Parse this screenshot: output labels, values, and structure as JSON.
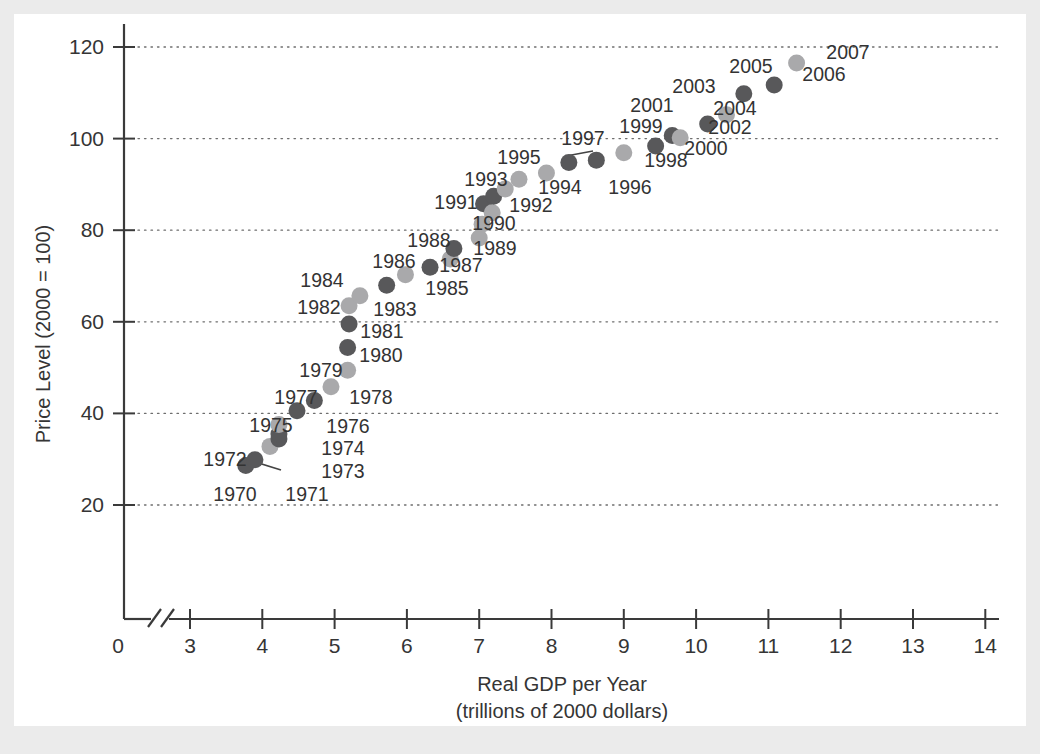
{
  "chart_data": {
    "type": "scatter",
    "title": "",
    "xlabel": "Real GDP per Year",
    "xlabel_sub": "(trillions of 2000 dollars)",
    "ylabel": "Price Level (2000 = 100)",
    "xlim": [
      3,
      14
    ],
    "ylim": [
      0,
      125
    ],
    "x_ticks": [
      "0",
      "3",
      "4",
      "5",
      "6",
      "7",
      "8",
      "9",
      "10",
      "11",
      "12",
      "13",
      "14"
    ],
    "y_ticks": [
      "20",
      "40",
      "60",
      "80",
      "100",
      "120"
    ],
    "grid": "horizontal dotted gridlines at each y tick",
    "axis_break": "broken x-axis between 0 and 3",
    "legend": "none",
    "marker_colors": {
      "dark": "#58585a",
      "light": "#a9a9ab"
    },
    "points": [
      {
        "label": "1970",
        "x": 3.772,
        "y": 28.6,
        "shade": "dark",
        "lx": 235,
        "ly": 501,
        "anchor": "middle"
      },
      {
        "label": "1971",
        "x": 3.898,
        "y": 29.9,
        "shade": "dark",
        "lx": 307,
        "ly": 501,
        "anchor": "middle"
      },
      {
        "label": "1972",
        "x": 4.106,
        "y": 32.8,
        "shade": "light",
        "lx": 225,
        "ly": 466,
        "anchor": "middle",
        "leader": [
          252,
          461,
          281,
          470
        ]
      },
      {
        "label": "1973",
        "x": 4.23,
        "y": 34.4,
        "shade": "dark",
        "lx": 343,
        "ly": 478,
        "anchor": "middle"
      },
      {
        "label": "1974",
        "x": 4.23,
        "y": 35.5,
        "shade": "dark",
        "lx": 343,
        "ly": 455,
        "anchor": "middle"
      },
      {
        "label": "1975",
        "x": 4.23,
        "y": 37.6,
        "shade": "light",
        "lx": 271,
        "ly": 432,
        "anchor": "middle"
      },
      {
        "label": "1976",
        "x": 4.48,
        "y": 40.6,
        "shade": "dark",
        "lx": 348,
        "ly": 433,
        "anchor": "middle"
      },
      {
        "label": "1977",
        "x": 4.72,
        "y": 42.8,
        "shade": "dark",
        "lx": 296,
        "ly": 404,
        "anchor": "middle"
      },
      {
        "label": "1978",
        "x": 4.95,
        "y": 45.8,
        "shade": "light",
        "lx": 371,
        "ly": 404,
        "anchor": "middle"
      },
      {
        "label": "1979",
        "x": 5.18,
        "y": 49.4,
        "shade": "light",
        "lx": 321,
        "ly": 377,
        "anchor": "middle"
      },
      {
        "label": "1980",
        "x": 5.18,
        "y": 54.4,
        "shade": "dark",
        "lx": 381,
        "ly": 362,
        "anchor": "middle"
      },
      {
        "label": "1981",
        "x": 5.2,
        "y": 59.5,
        "shade": "dark",
        "lx": 382,
        "ly": 338,
        "anchor": "middle"
      },
      {
        "label": "1982",
        "x": 5.2,
        "y": 63.5,
        "shade": "light",
        "lx": 319,
        "ly": 314,
        "anchor": "middle"
      },
      {
        "label": "1983",
        "x": 5.35,
        "y": 65.7,
        "shade": "light",
        "lx": 395,
        "ly": 316,
        "anchor": "middle"
      },
      {
        "label": "1984",
        "x": 5.72,
        "y": 68.0,
        "shade": "dark",
        "lx": 322,
        "ly": 287,
        "anchor": "middle"
      },
      {
        "label": "1985",
        "x": 5.98,
        "y": 70.3,
        "shade": "light",
        "lx": 447,
        "ly": 295,
        "anchor": "middle"
      },
      {
        "label": "1986",
        "x": 6.32,
        "y": 71.9,
        "shade": "dark",
        "lx": 394,
        "ly": 268,
        "anchor": "middle"
      },
      {
        "label": "1987",
        "x": 6.6,
        "y": 73.7,
        "shade": "light",
        "lx": 461,
        "ly": 272,
        "anchor": "middle"
      },
      {
        "label": "1988",
        "x": 6.65,
        "y": 76.0,
        "shade": "dark",
        "lx": 429,
        "ly": 247,
        "anchor": "middle"
      },
      {
        "label": "1989",
        "x": 7.0,
        "y": 78.3,
        "shade": "light",
        "lx": 495,
        "ly": 255,
        "anchor": "middle"
      },
      {
        "label": "1990",
        "x": 7.04,
        "y": 81.3,
        "shade": "light",
        "lx": 494,
        "ly": 230,
        "anchor": "middle"
      },
      {
        "label": "1991",
        "x": 7.06,
        "y": 85.8,
        "shade": "dark",
        "lx": 456,
        "ly": 209,
        "anchor": "middle"
      },
      {
        "label": "1992",
        "x": 7.18,
        "y": 83.8,
        "shade": "light",
        "lx": 531,
        "ly": 212,
        "anchor": "middle"
      },
      {
        "label": "1993",
        "x": 7.2,
        "y": 87.4,
        "shade": "dark",
        "lx": 486,
        "ly": 186,
        "anchor": "middle"
      },
      {
        "label": "1994",
        "x": 7.36,
        "y": 89.0,
        "shade": "light",
        "lx": 560,
        "ly": 194,
        "anchor": "middle"
      },
      {
        "label": "1995",
        "x": 7.55,
        "y": 91.1,
        "shade": "light",
        "lx": 519,
        "ly": 164,
        "anchor": "middle"
      },
      {
        "label": "1996",
        "x": 7.93,
        "y": 92.5,
        "shade": "light",
        "lx": 630,
        "ly": 194,
        "anchor": "middle"
      },
      {
        "label": "1997",
        "x": 8.24,
        "y": 94.8,
        "shade": "dark",
        "lx": 583,
        "ly": 145,
        "anchor": "middle"
      },
      {
        "label": "1998",
        "x": 8.62,
        "y": 95.3,
        "shade": "dark",
        "lx": 666,
        "ly": 167,
        "anchor": "middle"
      },
      {
        "label": "1999",
        "x": 9.0,
        "y": 96.9,
        "shade": "light",
        "lx": 641,
        "ly": 133,
        "anchor": "middle"
      },
      {
        "label": "2000",
        "x": 9.44,
        "y": 98.4,
        "shade": "dark",
        "lx": 706,
        "ly": 155,
        "anchor": "middle"
      },
      {
        "label": "2001",
        "x": 9.67,
        "y": 100.7,
        "shade": "dark",
        "lx": 652,
        "ly": 112,
        "anchor": "middle"
      },
      {
        "label": "2002",
        "x": 9.78,
        "y": 100.2,
        "shade": "light",
        "lx": 730,
        "ly": 134,
        "anchor": "middle"
      },
      {
        "label": "2003",
        "x": 10.16,
        "y": 103.2,
        "shade": "dark",
        "lx": 694,
        "ly": 93,
        "anchor": "middle"
      },
      {
        "label": "2004",
        "x": 10.42,
        "y": 105.2,
        "shade": "light",
        "lx": 735,
        "ly": 115,
        "anchor": "middle"
      },
      {
        "label": "2005",
        "x": 10.66,
        "y": 109.8,
        "shade": "dark",
        "lx": 751,
        "ly": 73,
        "anchor": "middle"
      },
      {
        "label": "2006",
        "x": 11.08,
        "y": 111.7,
        "shade": "dark",
        "lx": 824,
        "ly": 81,
        "anchor": "middle"
      },
      {
        "label": "2007",
        "x": 11.39,
        "y": 116.5,
        "shade": "light",
        "lx": 848,
        "ly": 59,
        "anchor": "middle"
      }
    ]
  }
}
